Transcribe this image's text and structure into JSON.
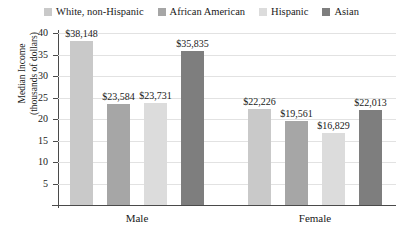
{
  "chart_data": {
    "type": "bar",
    "title": "",
    "xlabel": "",
    "ylabel": "Median Income (thousands of dollars)",
    "ylabel_line1": "Median Income",
    "ylabel_line2": "(thousands of dollars)",
    "categories": [
      "Male",
      "Female"
    ],
    "ylim": [
      0,
      40
    ],
    "ytick_labels": [
      "5",
      "10",
      "15",
      "20",
      "25",
      "30",
      "35",
      "40"
    ],
    "ytick_values": [
      5,
      10,
      15,
      20,
      25,
      30,
      35,
      40
    ],
    "grid": true,
    "legend_position": "top",
    "units": "thousands of dollars",
    "series": [
      {
        "name": "White, non-Hispanic",
        "color": "#c9c9c9",
        "values": [
          38.148,
          22.226
        ],
        "labels": [
          "$38,148",
          "$22,226"
        ]
      },
      {
        "name": "African American",
        "color": "#a6a6a6",
        "values": [
          23.584,
          19.561
        ],
        "labels": [
          "$23,584",
          "$19,561"
        ]
      },
      {
        "name": "Hispanic",
        "color": "#dcdcdc",
        "values": [
          23.731,
          16.829
        ],
        "labels": [
          "$23,731",
          "$16,829"
        ]
      },
      {
        "name": "Asian",
        "color": "#7e7e7e",
        "values": [
          35.835,
          22.013
        ],
        "labels": [
          "$35,835",
          "$22,013"
        ]
      }
    ]
  },
  "legend": {
    "items": [
      {
        "label": "White, non-Hispanic",
        "color": "#c9c9c9"
      },
      {
        "label": "African American",
        "color": "#a6a6a6"
      },
      {
        "label": "Hispanic",
        "color": "#dcdcdc"
      },
      {
        "label": "Asian",
        "color": "#7e7e7e"
      }
    ]
  },
  "axes": {
    "y": {
      "title_line1": "Median Income",
      "title_line2": "(thousands of dollars)",
      "ticks": [
        "40",
        "35",
        "30",
        "25",
        "20",
        "15",
        "10",
        "5"
      ]
    },
    "x": {
      "groups": [
        "Male",
        "Female"
      ]
    }
  },
  "bars": [
    {
      "group": "Male",
      "series": "White, non-Hispanic",
      "label": "$38,148",
      "value": 38.148,
      "color": "#c9c9c9"
    },
    {
      "group": "Male",
      "series": "African American",
      "label": "$23,584",
      "value": 23.584,
      "color": "#a6a6a6"
    },
    {
      "group": "Male",
      "series": "Hispanic",
      "label": "$23,731",
      "value": 23.731,
      "color": "#dcdcdc"
    },
    {
      "group": "Male",
      "series": "Asian",
      "label": "$35,835",
      "value": 35.835,
      "color": "#7e7e7e"
    },
    {
      "group": "Female",
      "series": "White, non-Hispanic",
      "label": "$22,226",
      "value": 22.226,
      "color": "#c9c9c9"
    },
    {
      "group": "Female",
      "series": "African American",
      "label": "$19,561",
      "value": 19.561,
      "color": "#a6a6a6"
    },
    {
      "group": "Female",
      "series": "Hispanic",
      "label": "$16,829",
      "value": 16.829,
      "color": "#dcdcdc"
    },
    {
      "group": "Female",
      "series": "Asian",
      "label": "$22,013",
      "value": 22.013,
      "color": "#7e7e7e"
    }
  ]
}
